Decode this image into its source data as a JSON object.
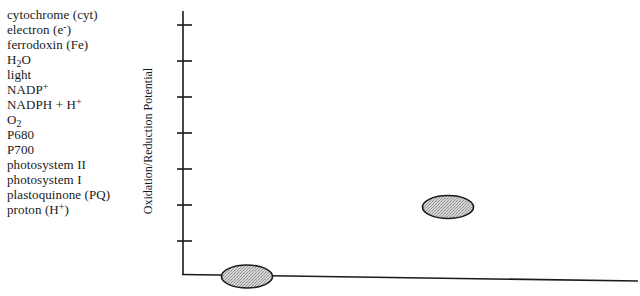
{
  "terms": [
    {
      "text": "cytochrome (cyt)"
    },
    {
      "text": "electron (e",
      "sup": "-",
      "after": ")"
    },
    {
      "text": "ferrodoxin (Fe)"
    },
    {
      "text": "H",
      "sub": "2",
      "after": "O"
    },
    {
      "text": "light"
    },
    {
      "text": "NADP",
      "sup": "+"
    },
    {
      "text": "NADPH + H",
      "sup": "+"
    },
    {
      "text": "O",
      "sub": "2"
    },
    {
      "text": "P680"
    },
    {
      "text": "P700"
    },
    {
      "text": "photosystem  II"
    },
    {
      "text": "photosystem  I"
    },
    {
      "text": "plastoquinone (PQ)"
    },
    {
      "text": "proton  (H",
      "sup": "+",
      "after": ")"
    }
  ],
  "axis": {
    "y_label": "Oxidation/Reduction Potential",
    "tick_count": 7
  },
  "shapes": [
    {
      "name": "blank-ellipse-upper",
      "cx": 448,
      "cy": 207,
      "rx": 26,
      "ry": 12
    },
    {
      "name": "blank-ellipse-lower",
      "cx": 247,
      "cy": 276,
      "rx": 26,
      "ry": 12
    }
  ],
  "colors": {
    "line": "#1a1a1a",
    "ellipse_fill": "#c8c8c8"
  }
}
